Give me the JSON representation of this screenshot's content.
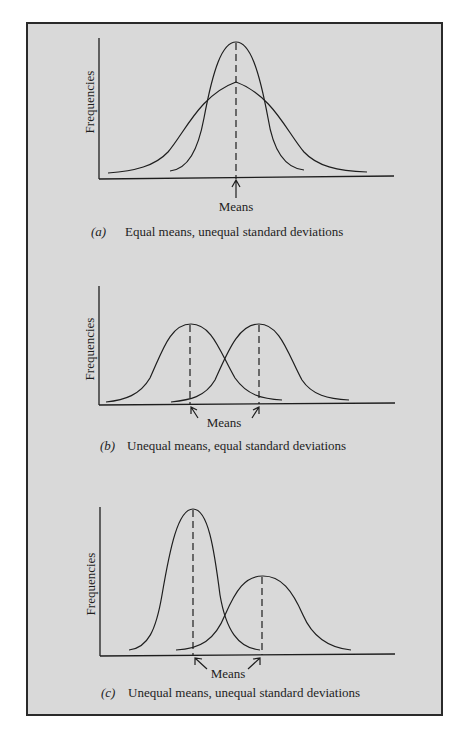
{
  "figure": {
    "background_color": "#d9d9d9",
    "line_color": "#1e1e1e",
    "panels": [
      {
        "id": "a",
        "letter": "(a)",
        "caption": "Equal means, unequal standard deviations",
        "y_axis_label": "Frequencies",
        "means_label": "Means",
        "curves": [
          {
            "name": "narrow-distribution",
            "mean": "same",
            "std": "small"
          },
          {
            "name": "wide-distribution",
            "mean": "same",
            "std": "large"
          }
        ]
      },
      {
        "id": "b",
        "letter": "(b)",
        "caption": "Unequal means, equal standard deviations",
        "y_axis_label": "Frequencies",
        "means_label": "Means",
        "curves": [
          {
            "name": "left-distribution",
            "mean": "lower",
            "std": "equal"
          },
          {
            "name": "right-distribution",
            "mean": "higher",
            "std": "equal"
          }
        ]
      },
      {
        "id": "c",
        "letter": "(c)",
        "caption": "Unequal means, unequal standard deviations",
        "y_axis_label": "Frequencies",
        "means_label": "Means",
        "curves": [
          {
            "name": "left-tall-distribution",
            "mean": "lower",
            "std": "small"
          },
          {
            "name": "right-short-distribution",
            "mean": "higher",
            "std": "large"
          }
        ]
      }
    ]
  }
}
